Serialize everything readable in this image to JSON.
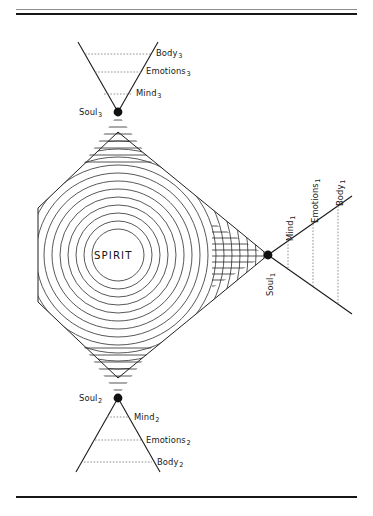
{
  "figure": {
    "center_label": "SPIRIT",
    "rules": {
      "top_thin": "thin-rule",
      "top_thick": "thick-rule",
      "bottom_thick": "thick-rule"
    },
    "caption": ""
  },
  "cones": {
    "top": {
      "id": "cone-3",
      "orientation": "up",
      "node_label": "Soul",
      "node_sub": "3",
      "levels": [
        {
          "label": "Body",
          "sub": "3"
        },
        {
          "label": "Emotions",
          "sub": "3"
        },
        {
          "label": "Mind",
          "sub": "3"
        }
      ]
    },
    "bottom": {
      "id": "cone-2",
      "orientation": "down",
      "node_label": "Soul",
      "node_sub": "2",
      "levels": [
        {
          "label": "Mind",
          "sub": "2"
        },
        {
          "label": "Emotions",
          "sub": "2"
        },
        {
          "label": "Body",
          "sub": "2"
        }
      ]
    },
    "right": {
      "id": "cone-1",
      "orientation": "right",
      "node_label": "Soul",
      "node_sub": "1",
      "levels": [
        {
          "label": "Mind",
          "sub": "1"
        },
        {
          "label": "Emotions",
          "sub": "1"
        },
        {
          "label": "Body",
          "sub": "1"
        }
      ]
    }
  },
  "colors": {
    "stroke": "#1a1a1a",
    "ring": "#3a3a3a",
    "dash": "#707070",
    "rule_thin": "#8d8d8d",
    "rule_thick": "#161616",
    "background": "#ffffff"
  },
  "geometry": {
    "spirit_center_x": 118,
    "spirit_center_y": 255,
    "ring_count": 14,
    "node_soul3": {
      "x": 118,
      "y": 112
    },
    "node_soul2": {
      "x": 118,
      "y": 398
    },
    "node_soul1": {
      "x": 268,
      "y": 255
    }
  }
}
